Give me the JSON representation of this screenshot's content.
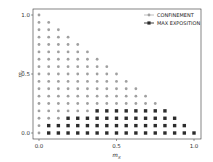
{
  "chart_data": {
    "type": "scatter",
    "title": "",
    "xlabel": "m_S",
    "ylabel": "m_I",
    "xlim": [
      0.0,
      1.0
    ],
    "ylim": [
      0.0,
      1.0
    ],
    "xticks": [
      "0.0",
      "0.5",
      "1.0"
    ],
    "yticks": [
      "0.0",
      "0.5",
      "1.0"
    ],
    "grid": false,
    "legend_position": "upper right",
    "grid_step": 0.0625,
    "domain_rule": "points on a 1/16 lattice with x + y <= 1",
    "series": [
      {
        "name": "CONFINEMENT",
        "marker": "circle",
        "color": "#a0a0a0",
        "description": "all lattice points with x + y <= 1 not in MAX EXPOSITION"
      },
      {
        "name": "MAX EXPOSITION",
        "marker": "square",
        "color": "#2b2b2b",
        "rows": [
          {
            "y": 0.0,
            "x_from": 0.0625,
            "x_to": 1.0
          },
          {
            "y": 0.0625,
            "x_from": 0.0625,
            "x_to": 0.9375
          },
          {
            "y": 0.125,
            "x_from": 0.1875,
            "x_to": 0.875
          },
          {
            "y": 0.1875,
            "x_from": 0.375,
            "x_to": 0.8125
          }
        ]
      }
    ]
  },
  "colors": {
    "confinement": "#a0a0a0",
    "max_exposition": "#2b2b2b",
    "axis": "#333333"
  }
}
